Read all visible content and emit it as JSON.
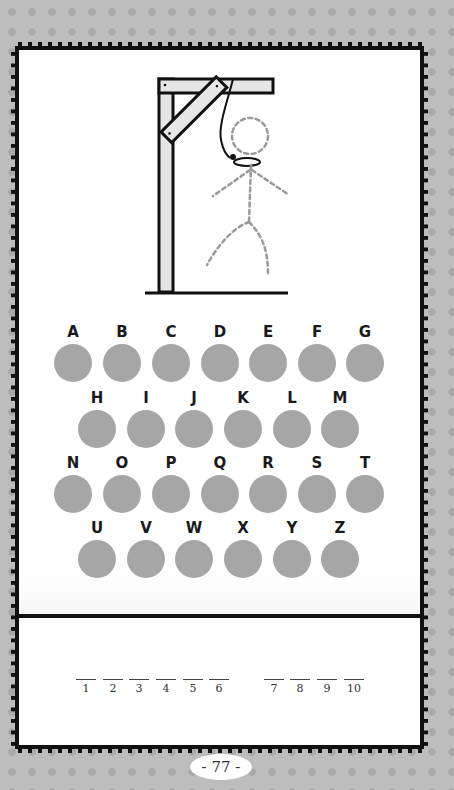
{
  "gallows": {
    "figure_style": "dashed",
    "parts": [
      "head",
      "body",
      "left-arm",
      "right-arm",
      "left-leg",
      "right-leg",
      "noose"
    ]
  },
  "letters": {
    "rows": [
      [
        "A",
        "B",
        "C",
        "D",
        "E",
        "F",
        "G"
      ],
      [
        "H",
        "I",
        "J",
        "K",
        "L",
        "M"
      ],
      [
        "N",
        "O",
        "P",
        "Q",
        "R",
        "S",
        "T"
      ],
      [
        "U",
        "V",
        "W",
        "X",
        "Y",
        "Z"
      ]
    ],
    "circle_color": "#a6a6a6"
  },
  "answer": {
    "words": [
      [
        "1",
        "2",
        "3",
        "4",
        "5",
        "6"
      ],
      [
        "7",
        "8",
        "9",
        "10"
      ]
    ]
  },
  "page_number": "- 77 -"
}
